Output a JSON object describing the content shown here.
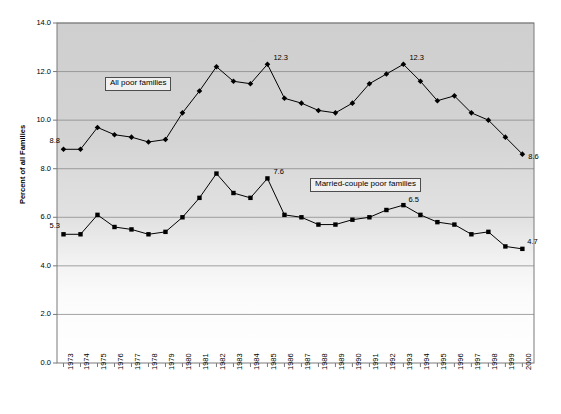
{
  "chart_data": {
    "type": "line",
    "title": "",
    "xlabel": "",
    "ylabel": "Percent of all Families",
    "ylim": [
      0.0,
      14.0
    ],
    "ytick_labels": [
      "0.0",
      "2.0",
      "4.0",
      "6.0",
      "8.0",
      "10.0",
      "12.0",
      "14.0"
    ],
    "ytick_values": [
      0.0,
      2.0,
      4.0,
      6.0,
      8.0,
      10.0,
      12.0,
      14.0
    ],
    "grid": "horizontal",
    "legend_position": "inline-boxes",
    "categories": [
      "1973",
      "1974",
      "1975",
      "1976",
      "1977",
      "1978",
      "1979",
      "1980",
      "1981",
      "1982",
      "1983",
      "1984",
      "1985",
      "1986",
      "1987",
      "1988",
      "1989",
      "1990",
      "1991",
      "1992",
      "1993",
      "1994",
      "1995",
      "1996",
      "1997",
      "1998",
      "1999",
      "2000"
    ],
    "series": [
      {
        "name": "All poor families",
        "marker": "diamond",
        "color": "#000000",
        "values": [
          8.8,
          8.8,
          9.7,
          9.4,
          9.3,
          9.1,
          9.2,
          10.3,
          11.2,
          12.2,
          11.6,
          11.5,
          12.3,
          10.9,
          10.7,
          10.4,
          10.3,
          10.7,
          11.5,
          11.9,
          12.3,
          11.6,
          10.8,
          11.0,
          10.3,
          10.0,
          9.3,
          8.6
        ],
        "annotations": [
          {
            "category": "1973",
            "value": 8.8,
            "text": "8.8"
          },
          {
            "category": "1985",
            "value": 12.3,
            "text": "12.3"
          },
          {
            "category": "1993",
            "value": 12.3,
            "text": "12.3"
          },
          {
            "category": "2000",
            "value": 8.6,
            "text": "8.6"
          }
        ]
      },
      {
        "name": "Married-couple poor families",
        "marker": "square",
        "color": "#000000",
        "values": [
          5.3,
          5.3,
          6.1,
          5.6,
          5.5,
          5.3,
          5.4,
          6.0,
          6.8,
          7.8,
          7.0,
          6.8,
          7.6,
          6.1,
          6.0,
          5.7,
          5.7,
          5.9,
          6.0,
          6.3,
          6.5,
          6.1,
          5.8,
          5.7,
          5.3,
          5.4,
          4.8,
          4.7
        ],
        "annotations": [
          {
            "category": "1973",
            "value": 5.3,
            "text": "5.3"
          },
          {
            "category": "1985",
            "value": 7.6,
            "text": "7.6"
          },
          {
            "category": "1993",
            "value": 6.5,
            "text": "6.5"
          },
          {
            "category": "2000",
            "value": 4.7,
            "text": "4.7"
          }
        ]
      }
    ]
  },
  "labels": {
    "series_1_box": "All poor families",
    "series_2_box": "Married-couple poor families",
    "y_axis_title": "Percent of all Families",
    "title": ""
  }
}
